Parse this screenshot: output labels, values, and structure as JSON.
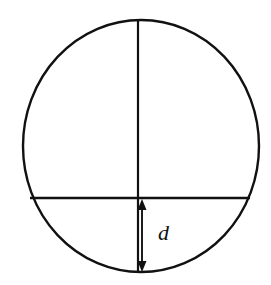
{
  "figure": {
    "kind": "geometry-diagram",
    "background_color": "#ffffff",
    "stroke_color": "#111111",
    "canvas": {
      "width": 271,
      "height": 285
    }
  },
  "circle": {
    "name": "circle-outline",
    "center_x": 141,
    "center_y": 146,
    "radius_x": 118,
    "radius_y": 126,
    "stroke_width": 2.4
  },
  "diameter": {
    "name": "vertical-diameter",
    "x": 138,
    "y_top": 20,
    "y_bottom": 272,
    "stroke_width": 2.2
  },
  "chord": {
    "name": "horizontal-chord",
    "y": 198,
    "x_left": 30,
    "x_right": 250,
    "stroke_width": 2.4
  },
  "dimension": {
    "name": "segment-depth-dimension",
    "label": "d",
    "x": 142,
    "y_top": 199,
    "y_bottom": 272,
    "label_x": 158,
    "label_y": 240,
    "arrowhead_width": 9,
    "arrowhead_height": 11,
    "both_ends_arrowed": true
  }
}
